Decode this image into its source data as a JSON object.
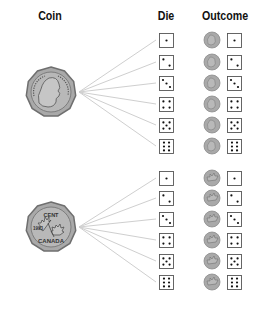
{
  "headers": {
    "coin": "Coin",
    "die": "Die",
    "outcome": "Outcome"
  },
  "coins": [
    {
      "side": "heads",
      "icon": "coin-heads-icon",
      "label": "Heads (Queen portrait)"
    },
    {
      "side": "tails",
      "icon": "coin-tails-icon",
      "label": "Tails (maple leaf, CENT 1993 CANADA)",
      "text_top": "CENT",
      "text_year": "1993",
      "text_bottom": "CANADA"
    }
  ],
  "die_faces": [
    1,
    2,
    3,
    4,
    5,
    6
  ],
  "outcomes": [
    {
      "coin": "heads",
      "die": 1
    },
    {
      "coin": "heads",
      "die": 2
    },
    {
      "coin": "heads",
      "die": 3
    },
    {
      "coin": "heads",
      "die": 4
    },
    {
      "coin": "heads",
      "die": 5
    },
    {
      "coin": "heads",
      "die": 6
    },
    {
      "coin": "tails",
      "die": 1
    },
    {
      "coin": "tails",
      "die": 2
    },
    {
      "coin": "tails",
      "die": 3
    },
    {
      "coin": "tails",
      "die": 4
    },
    {
      "coin": "tails",
      "die": 5
    },
    {
      "coin": "tails",
      "die": 6
    }
  ],
  "colors": {
    "coin_fill": "#a9a9a9",
    "coin_edge": "#6f6f6f",
    "line": "#cfcfcf",
    "die_border": "#555555",
    "pip": "#111111"
  }
}
